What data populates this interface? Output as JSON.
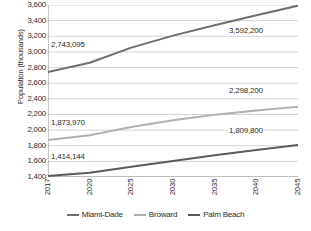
{
  "chart_data": {
    "type": "line",
    "title": "",
    "xlabel": "",
    "ylabel": "Population (thousands)",
    "categories": [
      "2017",
      "2020",
      "2025",
      "2030",
      "2035",
      "2040",
      "2045"
    ],
    "ylim": [
      1400,
      3600
    ],
    "y_ticks": [
      "3,600",
      "3,400",
      "3,200",
      "3,000",
      "2,800",
      "2,600",
      "2,400",
      "2,200",
      "2,000",
      "1,800",
      "1,600",
      "1,400"
    ],
    "y_tick_values": [
      3600,
      3400,
      3200,
      3000,
      2800,
      2600,
      2400,
      2200,
      2000,
      1800,
      1600,
      1400
    ],
    "grid": true,
    "legend_position": "bottom",
    "series": [
      {
        "name": "Miami-Dade",
        "color": "#6e6e6e",
        "values": [
          2743,
          2862,
          3055,
          3208,
          3340,
          3470,
          3592
        ],
        "start_label": "2,743,095",
        "end_label": "3,592,200"
      },
      {
        "name": "Broward",
        "color": "#b0b0b0",
        "values": [
          1874,
          1935,
          2040,
          2125,
          2196,
          2252,
          2298
        ],
        "start_label": "1,873,970",
        "end_label": "2,298,200"
      },
      {
        "name": "Palm Beach",
        "color": "#5a5a5a",
        "values": [
          1414,
          1455,
          1530,
          1604,
          1677,
          1746,
          1810
        ],
        "start_label": "1,414,144",
        "end_label": "1,809,800"
      }
    ]
  },
  "legend": {
    "items": [
      {
        "label": "Miami-Dade",
        "color": "#6e6e6e"
      },
      {
        "label": "Broward",
        "color": "#b0b0b0"
      },
      {
        "label": "Palm Beach",
        "color": "#5a5a5a"
      }
    ]
  },
  "labels": {
    "miami_start": "2,743,095",
    "miami_end": "3,592,200",
    "broward_start": "1,873,970",
    "broward_end": "2,298,200",
    "palm_start": "1,414,144",
    "palm_end": "1,809,800"
  },
  "colors": {
    "axis": "#888888",
    "grid": "#c8c8c8",
    "text": "#2b2b2b",
    "background": "#ffffff"
  }
}
